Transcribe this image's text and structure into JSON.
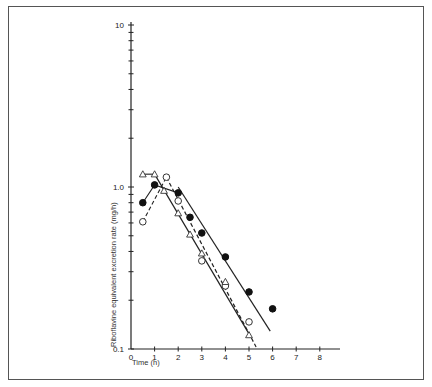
{
  "chart_data": {
    "type": "scatter",
    "title": "",
    "xlabel": "Time (h)",
    "ylabel": "Riboflavine equivalent excretion rate (mg/h)",
    "xlim": [
      0,
      8.8
    ],
    "ylim": [
      0.1,
      10
    ],
    "yscale": "log",
    "x_ticks": [
      0,
      1,
      2,
      3,
      4,
      5,
      6,
      7,
      8
    ],
    "x_tick_labels": [
      "0",
      "1",
      "2",
      "3",
      "4",
      "5",
      "6",
      "7",
      "8"
    ],
    "y_tick_labels": [
      {
        "value": 0.1,
        "label": "0.1"
      },
      {
        "value": 1.0,
        "label": "1.0"
      },
      {
        "value": 10,
        "label": "10"
      }
    ],
    "grid": false,
    "legend": null,
    "series": [
      {
        "name": "filled-circles",
        "marker": "filled-circle",
        "points": [
          [
            0.5,
            0.8
          ],
          [
            1,
            1.03
          ],
          [
            2,
            0.92
          ],
          [
            2.5,
            0.65
          ],
          [
            3,
            0.52
          ],
          [
            4,
            0.37
          ],
          [
            5,
            0.225
          ],
          [
            6,
            0.177
          ]
        ],
        "connect_points_upto": 3,
        "fit_line": {
          "style": "solid",
          "from": [
            2,
            1.0
          ],
          "to": [
            5.9,
            0.129
          ]
        }
      },
      {
        "name": "open-circles",
        "marker": "open-circle",
        "points": [
          [
            0.5,
            0.61
          ],
          [
            1.5,
            1.15
          ],
          [
            2,
            0.82
          ],
          [
            3,
            0.35
          ],
          [
            4,
            0.245
          ],
          [
            5,
            0.147
          ]
        ],
        "connect_points_upto": 2,
        "connect_style": "dashed",
        "fit_line": {
          "style": "dashed",
          "from": [
            1.5,
            1.15
          ],
          "to": [
            5.3,
            0.103
          ]
        }
      },
      {
        "name": "open-triangles",
        "marker": "open-triangle",
        "points": [
          [
            0.5,
            1.2
          ],
          [
            1,
            1.2
          ],
          [
            1.4,
            0.95
          ],
          [
            2,
            0.69
          ],
          [
            2.5,
            0.51
          ],
          [
            3,
            0.39
          ],
          [
            4,
            0.26
          ],
          [
            5,
            0.122
          ]
        ],
        "connect_points_upto": 2,
        "fit_line": {
          "style": "solid",
          "from": [
            1,
            1.2
          ],
          "to": [
            5,
            0.124
          ]
        }
      }
    ]
  }
}
